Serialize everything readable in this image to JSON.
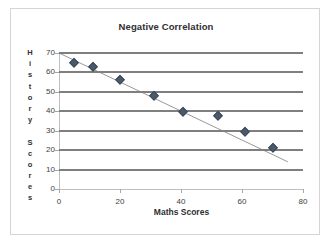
{
  "chart_data": {
    "type": "scatter",
    "title": "Negative Correlation",
    "xlabel": "Maths Scores",
    "ylabel": "History Scores",
    "xlim": [
      0,
      80
    ],
    "ylim": [
      0,
      70
    ],
    "grid": true,
    "legend": "none",
    "x_ticks": [
      "0",
      "20",
      "40",
      "60",
      "80"
    ],
    "y_ticks": [
      "0",
      "10",
      "20",
      "30",
      "40",
      "50",
      "60",
      "70"
    ],
    "x_tick_values": [
      0,
      20,
      40,
      60,
      80
    ],
    "y_tick_values": [
      0,
      10,
      20,
      30,
      40,
      50,
      60,
      70
    ],
    "series": [
      {
        "name": "History vs Maths",
        "marker": "diamond",
        "color": "#4a5a6a",
        "points": [
          {
            "x": 5,
            "y": 65
          },
          {
            "x": 11,
            "y": 63
          },
          {
            "x": 20,
            "y": 56
          },
          {
            "x": 31,
            "y": 48
          },
          {
            "x": 40.5,
            "y": 39.5
          },
          {
            "x": 52,
            "y": 37.5
          },
          {
            "x": 61,
            "y": 29.5
          },
          {
            "x": 70,
            "y": 21
          }
        ]
      }
    ],
    "trendline": {
      "name": "linear trend",
      "color": "#8c8c8c",
      "x_start": 0,
      "y_start": 70,
      "x_end": 75,
      "y_end": 14
    },
    "gridline_color": "#7f7f7f",
    "axis_color": "#bfbfbf",
    "border_color": "#d5d5d5"
  },
  "ylabel_letters": [
    "H",
    "i",
    "s",
    "t",
    "o",
    "r",
    "y",
    "",
    "S",
    "c",
    "o",
    "r",
    "e",
    "s"
  ]
}
